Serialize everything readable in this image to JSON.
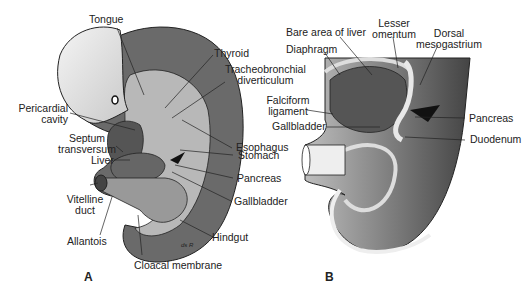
{
  "figure": {
    "panels": [
      {
        "id": "A",
        "label": "A"
      },
      {
        "id": "B",
        "label": "B"
      }
    ],
    "signature": "ds R",
    "panel_a_labels": {
      "tongue": "Tongue",
      "thyroid": "Thyroid",
      "tracheobronchial_1": "Tracheobronchial",
      "tracheobronchial_2": "diverticulum",
      "pericardial_1": "Pericardial",
      "pericardial_2": "cavity",
      "septum_1": "Septum",
      "septum_2": "transversum",
      "esophagus": "Esophagus",
      "liver": "Liver",
      "stomach": "Stomach",
      "pancreas": "Pancreas",
      "vitelline_1": "Vitelline",
      "vitelline_2": "duct",
      "gallbladder": "Gallbladder",
      "allantois": "Allantois",
      "hindgut": "Hindgut",
      "cloacal": "Cloacal membrane"
    },
    "panel_b_labels": {
      "bare_area": "Bare area of liver",
      "lesser_1": "Lesser",
      "lesser_2": "omentum",
      "dorsal_1": "Dorsal",
      "dorsal_2": "mesogastrium",
      "diaphragm": "Diaphragm",
      "falciform_1": "Falciform",
      "falciform_2": "ligament",
      "gallbladder": "Gallbladder",
      "pancreas": "Pancreas",
      "duodenum": "Duodenum"
    }
  }
}
